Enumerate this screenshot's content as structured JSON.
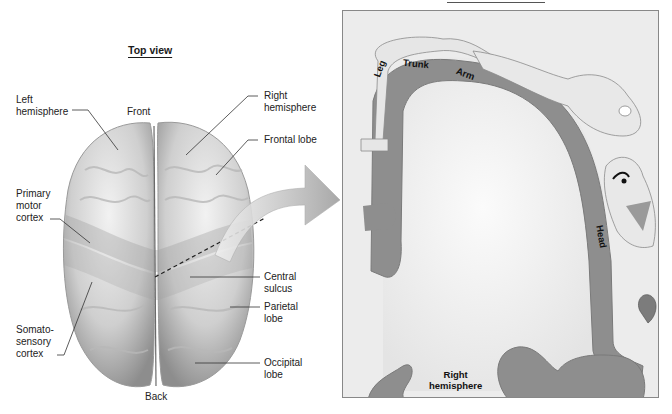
{
  "figure": {
    "left_title": "Top view",
    "orientation": {
      "front": "Front",
      "back": "Back"
    },
    "left_labels": [
      {
        "id": "left-hemisphere",
        "text": "Left\nhemisphere"
      },
      {
        "id": "primary-motor-cortex",
        "text": "Primary\nmotor\ncortex"
      },
      {
        "id": "somatosensory-cortex",
        "text": "Somato-\nsensory\ncortex"
      }
    ],
    "right_labels": [
      {
        "id": "right-hemisphere",
        "text": "Right\nhemisphere"
      },
      {
        "id": "frontal-lobe",
        "text": "Frontal lobe"
      },
      {
        "id": "central-sulcus",
        "text": "Central\nsulcus"
      },
      {
        "id": "parietal-lobe",
        "text": "Parietal\nlobe"
      },
      {
        "id": "occipital-lobe",
        "text": "Occipital\nlobe"
      }
    ],
    "homunculus_panel": {
      "body_labels": [
        "Leg",
        "Trunk",
        "Arm",
        "Head"
      ],
      "hemisphere_label": "Right\nhemisphere"
    },
    "colors": {
      "brain": "#d4d4d4",
      "cortex_strip": "#8e8e8e",
      "panel_bg": "#ececec",
      "arrow": "#bdbdbd"
    }
  }
}
